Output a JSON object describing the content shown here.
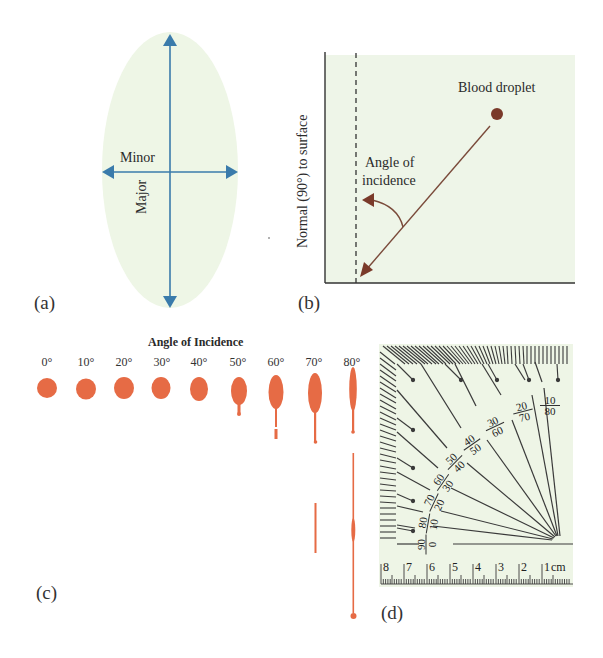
{
  "colors": {
    "ellipse_fill": "#eef6e6",
    "axis_blue": "#3a7bab",
    "panel_b_bg": "#eef5e8",
    "blood_brown": "#7a3a2a",
    "stain_orange": "#e66b45",
    "protractor_bg": "#eef5e6",
    "line_dark": "#3a3a3a"
  },
  "panel_a": {
    "label": "(a)",
    "minor_label": "Minor",
    "major_label": "Major"
  },
  "panel_b": {
    "label": "(b)",
    "y_axis_label": "Normal (90°) to surface",
    "droplet_label": "Blood droplet",
    "angle_label_line1": "Angle of",
    "angle_label_line2": "incidence"
  },
  "panel_c": {
    "label": "(c)",
    "title": "Angle of Incidence",
    "angles": [
      "0°",
      "10°",
      "20°",
      "30°",
      "40°",
      "50°",
      "60°",
      "70°",
      "80°"
    ]
  },
  "panel_d": {
    "label": "(d)",
    "protractor_labels": [
      {
        "top": "10",
        "bottom": "80"
      },
      {
        "top": "20",
        "bottom": "70"
      },
      {
        "top": "30",
        "bottom": "60"
      },
      {
        "top": "40",
        "bottom": "50"
      },
      {
        "top": "50",
        "bottom": "40"
      },
      {
        "top": "60",
        "bottom": "30"
      },
      {
        "top": "70",
        "bottom": "20"
      },
      {
        "top": "80",
        "bottom": "10"
      },
      {
        "top": "90",
        "bottom": "0"
      }
    ],
    "ruler_numbers": [
      "8",
      "7",
      "6",
      "5",
      "4",
      "3",
      "2",
      "1"
    ],
    "ruler_unit": "cm"
  }
}
